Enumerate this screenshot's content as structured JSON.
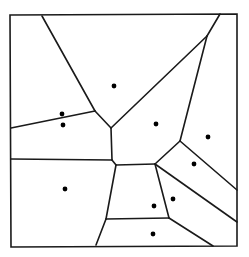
{
  "diagram": {
    "type": "voronoi",
    "stroke_color": "#1a1a1a",
    "point_color": "#000000",
    "background": "#ffffff",
    "border": [
      [
        10,
        15
      ],
      [
        237,
        14
      ],
      [
        237,
        246
      ],
      [
        11,
        247
      ]
    ],
    "edges": [
      [
        [
          42,
          16
        ],
        [
          95,
          111
        ]
      ],
      [
        [
          95,
          111
        ],
        [
          11,
          128
        ]
      ],
      [
        [
          95,
          111
        ],
        [
          111,
          128
        ]
      ],
      [
        [
          111,
          128
        ],
        [
          207,
          36
        ]
      ],
      [
        [
          207,
          36
        ],
        [
          220,
          14
        ]
      ],
      [
        [
          207,
          36
        ],
        [
          180,
          141
        ]
      ],
      [
        [
          111,
          128
        ],
        [
          112,
          160
        ]
      ],
      [
        [
          112,
          160
        ],
        [
          11,
          159
        ]
      ],
      [
        [
          112,
          160
        ],
        [
          116,
          165
        ]
      ],
      [
        [
          116,
          165
        ],
        [
          155,
          164
        ]
      ],
      [
        [
          155,
          164
        ],
        [
          180,
          141
        ]
      ],
      [
        [
          180,
          141
        ],
        [
          237,
          190
        ]
      ],
      [
        [
          155,
          164
        ],
        [
          237,
          222
        ]
      ],
      [
        [
          116,
          165
        ],
        [
          106,
          219
        ]
      ],
      [
        [
          106,
          219
        ],
        [
          96,
          245
        ]
      ],
      [
        [
          106,
          219
        ],
        [
          169,
          218
        ]
      ],
      [
        [
          155,
          164
        ],
        [
          169,
          218
        ]
      ],
      [
        [
          169,
          218
        ],
        [
          213,
          246
        ]
      ]
    ],
    "sites": [
      [
        114,
        86
      ],
      [
        62,
        114
      ],
      [
        63,
        125
      ],
      [
        156,
        124
      ],
      [
        208,
        137
      ],
      [
        194,
        164
      ],
      [
        65,
        189
      ],
      [
        173,
        199
      ],
      [
        154,
        206
      ],
      [
        153,
        234
      ]
    ]
  }
}
